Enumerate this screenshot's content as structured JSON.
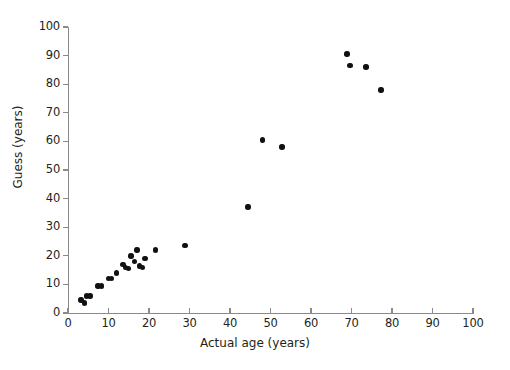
{
  "chart_data": {
    "type": "scatter",
    "title": "",
    "xlabel": "Actual age (years)",
    "ylabel": "Guess (years)",
    "xlim": [
      0,
      100
    ],
    "ylim": [
      0,
      100
    ],
    "xticks": [
      0,
      10,
      20,
      30,
      40,
      50,
      60,
      70,
      80,
      90,
      100
    ],
    "yticks": [
      0,
      10,
      20,
      30,
      40,
      50,
      60,
      70,
      80,
      90,
      100
    ],
    "grid": false,
    "legend": "none",
    "marker": {
      "shape": "circle",
      "color": "#111111",
      "size": 5
    },
    "axis_color": "#8a8a8a",
    "series": [
      {
        "name": "Guess vs actual age",
        "points": [
          [
            3.2,
            4.5
          ],
          [
            4.0,
            3.5
          ],
          [
            4.6,
            6.0
          ],
          [
            5.4,
            6.0
          ],
          [
            7.4,
            9.5
          ],
          [
            8.2,
            9.5
          ],
          [
            10.0,
            12.0
          ],
          [
            10.8,
            12.0
          ],
          [
            12.0,
            14.0
          ],
          [
            13.6,
            17.0
          ],
          [
            14.2,
            16.0
          ],
          [
            15.0,
            15.5
          ],
          [
            15.6,
            20.0
          ],
          [
            16.4,
            18.0
          ],
          [
            17.0,
            22.0
          ],
          [
            17.6,
            16.5
          ],
          [
            18.4,
            16.0
          ],
          [
            19.0,
            19.0
          ],
          [
            21.6,
            22.0
          ],
          [
            28.9,
            23.5
          ],
          [
            44.4,
            37.0
          ],
          [
            48.0,
            60.5
          ],
          [
            52.8,
            58.0
          ],
          [
            68.9,
            90.5
          ],
          [
            69.6,
            86.5
          ],
          [
            73.6,
            86.0
          ],
          [
            77.3,
            78.0
          ]
        ]
      }
    ]
  },
  "axes": {
    "x_title": "Actual age (years)",
    "y_title": "Guess (years)",
    "x_tick_labels": [
      "0",
      "10",
      "20",
      "30",
      "40",
      "50",
      "60",
      "70",
      "80",
      "90",
      "100"
    ],
    "y_tick_labels": [
      "0",
      "10",
      "20",
      "30",
      "40",
      "50",
      "60",
      "70",
      "80",
      "90",
      "100"
    ]
  }
}
